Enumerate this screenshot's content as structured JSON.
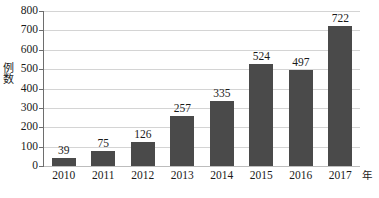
{
  "chart_data": {
    "type": "bar",
    "title": "",
    "xlabel": "年",
    "ylabel": "例数",
    "categories": [
      "2010",
      "2011",
      "2012",
      "2013",
      "2014",
      "2015",
      "2016",
      "2017"
    ],
    "values": [
      39,
      75,
      126,
      257,
      335,
      524,
      497,
      722
    ],
    "value_labels": [
      "39",
      "75",
      "126",
      "257",
      "335",
      "524",
      "497",
      "722"
    ],
    "ylim": [
      0,
      800
    ],
    "ytick_labels": [
      "0",
      "100",
      "200",
      "300",
      "400",
      "500",
      "600",
      "700",
      "800"
    ],
    "ytick_values": [
      0,
      100,
      200,
      300,
      400,
      500,
      600,
      700,
      800
    ],
    "grid": true,
    "legend": "none",
    "series": [
      {
        "name": "例数",
        "values": [
          39,
          75,
          126,
          257,
          335,
          524,
          497,
          722
        ]
      }
    ],
    "colors": {
      "bar": "#4a4a4a",
      "gridline": "#d4d4d4",
      "axis": "#6e6e6e",
      "text": "#1a1a1a",
      "background": "#ffffff"
    }
  }
}
